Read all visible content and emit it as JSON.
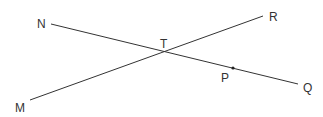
{
  "diagram": {
    "type": "intersecting-lines",
    "lines": [
      {
        "name": "NQ",
        "from": "N",
        "to": "Q"
      },
      {
        "name": "MR",
        "from": "M",
        "to": "R"
      }
    ],
    "points": {
      "N": {
        "label": "N",
        "x": 51,
        "y": 24
      },
      "R": {
        "label": "R",
        "x": 263,
        "y": 16
      },
      "T": {
        "label": "T",
        "x": 164,
        "y": 52
      },
      "P": {
        "label": "P",
        "x": 233,
        "y": 68
      },
      "Q": {
        "label": "Q",
        "x": 298,
        "y": 84
      },
      "M": {
        "label": "M",
        "x": 30,
        "y": 100
      }
    },
    "line_color": "#333333"
  }
}
